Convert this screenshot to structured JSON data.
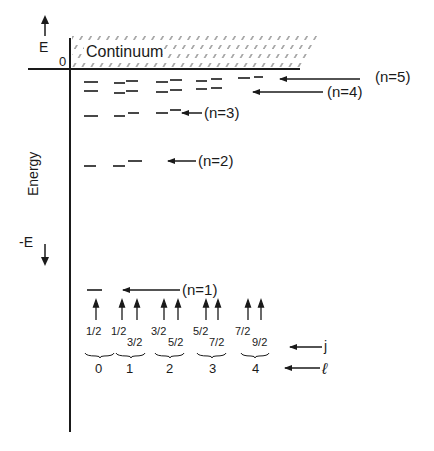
{
  "diagram": {
    "axis": {
      "positive_label": "E",
      "negative_label": "-E",
      "vertical_label": "Energy",
      "zero_label": "0"
    },
    "continuum_label": "Continuum",
    "shell_labels": [
      {
        "n": 5,
        "text": "(n=5)"
      },
      {
        "n": 4,
        "text": "(n=4)"
      },
      {
        "n": 3,
        "text": "(n=3)"
      },
      {
        "n": 2,
        "text": "(n=2)"
      },
      {
        "n": 1,
        "text": "(n=1)"
      }
    ],
    "j_values": [
      {
        "l": 0,
        "lower": "1/2",
        "upper": null
      },
      {
        "l": 1,
        "lower": "1/2",
        "upper": "3/2"
      },
      {
        "l": 2,
        "lower": "3/2",
        "upper": "5/2"
      },
      {
        "l": 3,
        "lower": "5/2",
        "upper": "7/2"
      },
      {
        "l": 4,
        "lower": "7/2",
        "upper": "9/2"
      }
    ],
    "l_values": [
      "0",
      "1",
      "2",
      "3",
      "4"
    ],
    "row_labels": {
      "j": "j",
      "l": "ℓ"
    },
    "colors": {
      "ink": "#1a1a1a",
      "background": "#ffffff"
    }
  }
}
